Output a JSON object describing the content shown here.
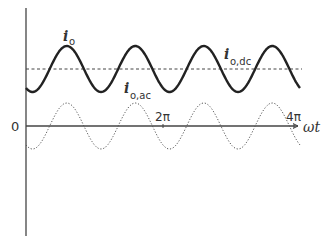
{
  "diagram": {
    "type": "waveform",
    "axis": {
      "origin_label": "0",
      "x_label": "ωt",
      "ticks": [
        {
          "label": "2π",
          "value_rad": 6.2832
        },
        {
          "label": "4π",
          "value_rad": 12.5664
        }
      ],
      "x_range_rad": [
        0,
        12.8
      ]
    },
    "curves": [
      {
        "name": "i_o",
        "label_main": "i",
        "label_sub": "o",
        "style": "solid",
        "offset": 1.0,
        "amplitude": 1.0,
        "cycles_per_2pi": 2,
        "phase_note": "starts near trough"
      },
      {
        "name": "i_o,dc",
        "label_main": "i",
        "label_sub": "o,dc",
        "style": "dashed",
        "offset": 1.0,
        "amplitude": 0
      },
      {
        "name": "i_o,ac",
        "label_main": "i",
        "label_sub": "o,ac",
        "style": "dotted",
        "offset": 0,
        "amplitude": 1.0,
        "cycles_per_2pi": 2
      }
    ]
  }
}
